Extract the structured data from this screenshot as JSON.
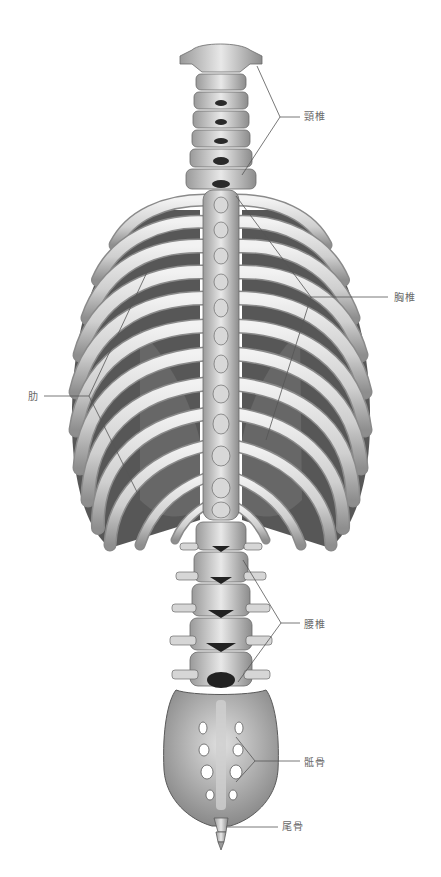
{
  "figure": {
    "colors": {
      "background": "#ffffff",
      "bone_light": "#e4e4e4",
      "bone_mid": "#b9b9b9",
      "bone_dark": "#6e6e6e",
      "shadow": "#2a2a2a",
      "leader_line": "#555555",
      "label_text": "#6a6a6a"
    }
  },
  "labels": [
    {
      "id": "cervical",
      "text": "頸椎",
      "x": 304,
      "y": 111
    },
    {
      "id": "thoracic",
      "text": "胸椎",
      "x": 394,
      "y": 292
    },
    {
      "id": "ribs",
      "text": "肋",
      "x": 28,
      "y": 391
    },
    {
      "id": "lumbar",
      "text": "腰椎",
      "x": 304,
      "y": 619
    },
    {
      "id": "sacrum",
      "text": "骶骨",
      "x": 304,
      "y": 757
    },
    {
      "id": "coccyx",
      "text": "尾骨",
      "x": 282,
      "y": 821
    }
  ]
}
